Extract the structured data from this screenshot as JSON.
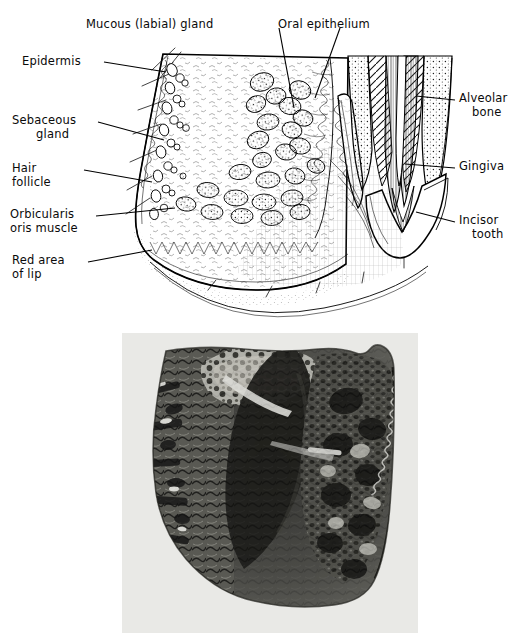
{
  "figure": {
    "type": "anatomical-illustration",
    "panels": [
      {
        "name": "line-drawing",
        "position": "top"
      },
      {
        "name": "photomicrograph",
        "position": "bottom"
      }
    ]
  },
  "labels": {
    "epidermis": "Epidermis",
    "mucous_gland": "Mucous (labial) gland",
    "oral_epithelium": "Oral epithelium",
    "alveolar_bone_l1": "Alveolar",
    "alveolar_bone_l2": "bone",
    "sebaceous_l1": "Sebaceous",
    "sebaceous_l2": "gland",
    "gingiva": "Gingiva",
    "hair_l1": "Hair",
    "hair_l2": "follicle",
    "orbicularis_l1": "Orbicularis",
    "orbicularis_l2": "oris muscle",
    "incisor_l1": "Incisor",
    "incisor_l2": "tooth",
    "red_area_l1": "Red area",
    "red_area_l2": "of lip"
  },
  "colors": {
    "ink": "#000000",
    "page": "#ffffff",
    "photo_border": "#e9e9e6",
    "photo_dark": "#141414",
    "photo_mid": "#6a6a66",
    "photo_light": "#d8d8d2"
  }
}
